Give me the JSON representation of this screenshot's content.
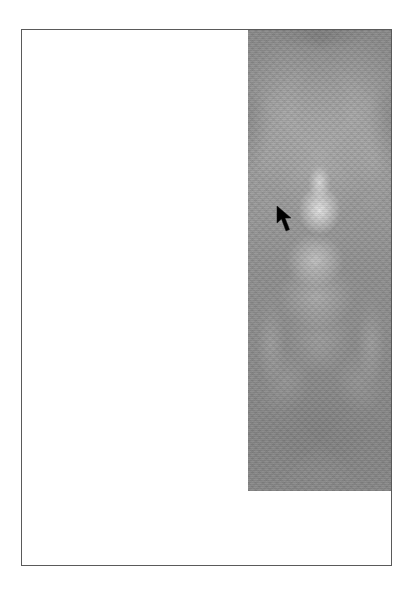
{
  "screen": {
    "background": "#ffffff"
  },
  "page": {
    "border_color": "#5a5a5a",
    "background": "#ffffff"
  },
  "image": {
    "description": "grayscale fractal texture, bright center glow with fan-shaped lighter rays",
    "palette": {
      "base": "#8e8e8e",
      "highlight": "#e8e8e8",
      "shadow": "#6e6e6e"
    }
  },
  "cursor": {
    "icon": "arrow-pointer-icon",
    "x": 277,
    "y": 206,
    "color": "#000000"
  }
}
